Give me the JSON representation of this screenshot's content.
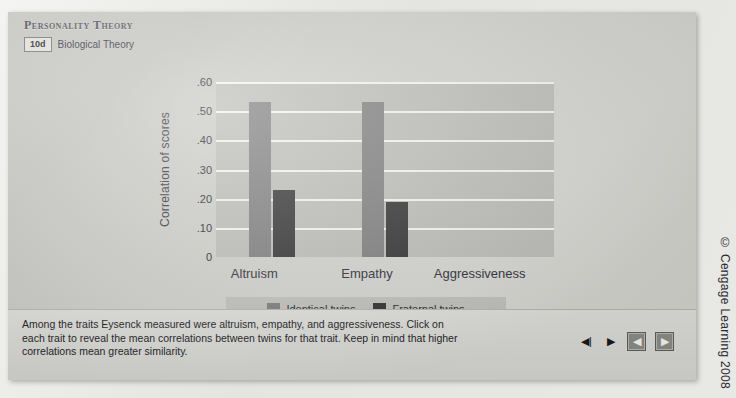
{
  "header": {
    "title": "Personality Theory",
    "module_badge": "10d",
    "module_label": "Biological Theory"
  },
  "caption": "Among the traits Eysenck measured were altruism, empathy, and aggressiveness. Click on each trait to reveal the mean correlations between twins for that trait. Keep in mind that higher correlations mean greater similarity.",
  "controls": [
    {
      "name": "volume-icon",
      "glyph": "◀|"
    },
    {
      "name": "play-icon",
      "glyph": "▶"
    },
    {
      "name": "previous-icon",
      "glyph": "◀"
    },
    {
      "name": "next-icon",
      "glyph": "▶"
    }
  ],
  "copyright": "© Cengage Learning 2008",
  "colors": {
    "identical": "#7a7a7a",
    "fraternal": "#2e2e2e",
    "plot_bg": "#b9b9b5",
    "gridline": "#f2f2ee"
  },
  "chart_data": {
    "type": "bar",
    "title": "",
    "xlabel": "",
    "ylabel": "Correlation of scores",
    "categories": [
      "Altruism",
      "Empathy",
      "Aggressiveness"
    ],
    "series": [
      {
        "name": "Identical twins",
        "values": [
          0.53,
          0.53,
          null
        ]
      },
      {
        "name": "Fraternal twins",
        "values": [
          0.23,
          0.19,
          null
        ]
      }
    ],
    "ylim": [
      0,
      0.6
    ],
    "yticks": [
      0.6,
      0.5,
      0.4,
      0.3,
      0.2,
      0.1,
      0
    ],
    "ytick_labels": [
      ".60",
      ".50",
      ".40",
      ".30",
      ".20",
      ".10",
      "0"
    ],
    "grid": true,
    "legend_position": "bottom",
    "note": "Aggressiveness bars not yet revealed"
  }
}
